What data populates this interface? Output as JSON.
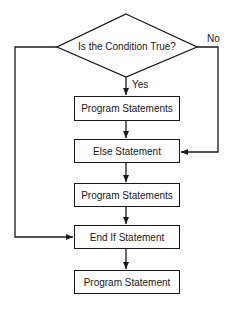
{
  "diagram": {
    "type": "flowchart",
    "decision": {
      "label": "Is the Condition True?"
    },
    "branches": {
      "yes_label": "Yes",
      "no_label": "No"
    },
    "boxes": [
      {
        "id": "program1",
        "label": "Program Statements"
      },
      {
        "id": "else",
        "label": "Else Statement"
      },
      {
        "id": "program2",
        "label": "Program Statements"
      },
      {
        "id": "endif",
        "label": "End If Statement"
      },
      {
        "id": "program3",
        "label": "Program Statement"
      }
    ],
    "colors": {
      "stroke": "#1a1a1a",
      "background": "#ffffff"
    }
  }
}
